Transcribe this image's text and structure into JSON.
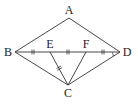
{
  "diagram": {
    "type": "geometry",
    "points": {
      "A": {
        "label": "A",
        "x": 69,
        "y": 18,
        "lx": 69,
        "ly": 14
      },
      "B": {
        "label": "B",
        "x": 15,
        "y": 52,
        "lx": 8,
        "ly": 56
      },
      "C": {
        "label": "C",
        "x": 68,
        "y": 85,
        "lx": 68,
        "ly": 97
      },
      "D": {
        "label": "D",
        "x": 120,
        "y": 52,
        "lx": 127,
        "ly": 56
      },
      "E": {
        "label": "E",
        "x": 50,
        "y": 52,
        "lx": 50,
        "ly": 48
      },
      "F": {
        "label": "F",
        "x": 86,
        "y": 52,
        "lx": 86,
        "ly": 48
      }
    },
    "segments": [
      "AB",
      "AD",
      "BD",
      "BC",
      "DC",
      "EC",
      "FC"
    ],
    "equal_marks": [
      "BE",
      "EF",
      "FD",
      "EC"
    ],
    "line_color": "#333333"
  }
}
